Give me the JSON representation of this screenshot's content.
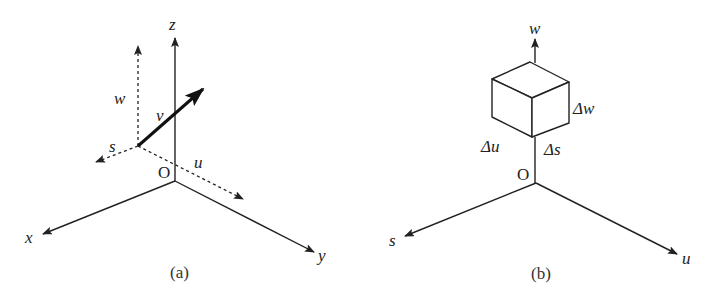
{
  "figure_a": {
    "caption": "(a)",
    "axes": {
      "x_label": "x",
      "y_label": "y",
      "z_label": "z",
      "origin_label": "O"
    },
    "local_axes": {
      "s_label": "s",
      "u_label": "u",
      "w_label": "w"
    },
    "vector_label": "v"
  },
  "figure_b": {
    "caption": "(b)",
    "axes": {
      "s_label": "s",
      "u_label": "u",
      "w_label": "w",
      "origin_label": "O"
    },
    "element_labels": {
      "du": "Δu",
      "ds": "Δs",
      "dw": "Δw"
    }
  }
}
